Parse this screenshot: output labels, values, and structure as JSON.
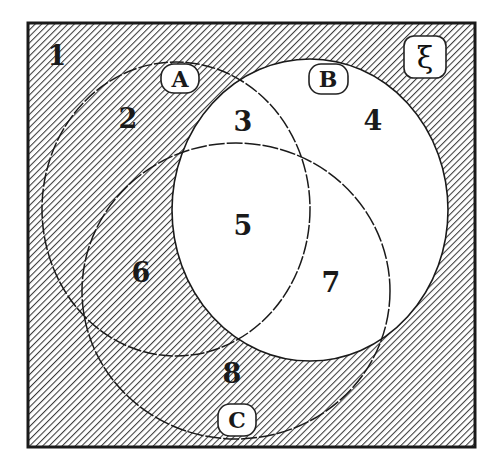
{
  "diagram": {
    "type": "venn",
    "universe": {
      "label": "ξ",
      "shaded": true
    },
    "sets": [
      {
        "name": "A",
        "label": "A",
        "shaded": true
      },
      {
        "name": "B",
        "label": "B",
        "shaded": false
      },
      {
        "name": "C",
        "label": "C",
        "shaded": true
      }
    ],
    "regions": [
      {
        "number": "1",
        "description": "outside A, B, C",
        "shaded": true
      },
      {
        "number": "2",
        "description": "A only",
        "shaded": true
      },
      {
        "number": "3",
        "description": "A ∩ B only",
        "shaded": false
      },
      {
        "number": "4",
        "description": "B only",
        "shaded": false
      },
      {
        "number": "5",
        "description": "A ∩ B ∩ C",
        "shaded": false
      },
      {
        "number": "6",
        "description": "A ∩ C only",
        "shaded": true
      },
      {
        "number": "7",
        "description": "B ∩ C only",
        "shaded": false
      },
      {
        "number": "8",
        "description": "C only",
        "shaded": true
      }
    ],
    "shading_summary": "B' (complement of B) is shaded",
    "colors": {
      "hatch": "#3a3a3a",
      "background": "#ffffff",
      "outline": "#1a1a1a"
    }
  }
}
